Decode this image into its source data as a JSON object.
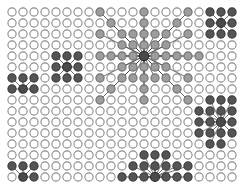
{
  "figure": {
    "title": "",
    "background_color": "#ffffff",
    "width": 244,
    "height": 189
  },
  "chart_data": {
    "type": "scatter",
    "title": "",
    "subtitle": "",
    "xlabel": "",
    "ylabel": "",
    "grid": false,
    "legend_position": "none",
    "lattice": {
      "columns": 21,
      "rows": 16,
      "origin_x": 12,
      "origin_y": 12,
      "spacing_x": 11.0,
      "spacing_y": 11.0,
      "node_radius": 4.1,
      "empty_node_fill": "#ffffff",
      "empty_node_stroke": "#8c8c8c",
      "empty_node_stroke_width": 1.1
    },
    "node_styles": {
      "light": {
        "fill": "#9d9d9d",
        "stroke": "#6e6e6e"
      },
      "dark": {
        "fill": "#555555",
        "stroke": "#3a3a3a"
      },
      "hub": {
        "fill": "#4a4a4a",
        "stroke": "#2e2e2e"
      }
    },
    "edge_style": {
      "color": "#4a4a4a",
      "width": 0.85,
      "opacity": 0.95
    },
    "clusters": [
      {
        "name": "large-central-hub",
        "hub_col": 12,
        "hub_row": 4,
        "hub_radius": 4.6,
        "node_style": "light",
        "spoke_count": 44,
        "max_spoke_reach": 5,
        "spokes": [
          [
            13,
            4
          ],
          [
            14,
            4
          ],
          [
            15,
            4
          ],
          [
            16,
            4
          ],
          [
            17,
            4
          ],
          [
            11,
            4
          ],
          [
            10,
            4
          ],
          [
            9,
            4
          ],
          [
            8,
            4
          ],
          [
            12,
            3
          ],
          [
            12,
            2
          ],
          [
            12,
            1
          ],
          [
            12,
            0
          ],
          [
            12,
            5
          ],
          [
            12,
            6
          ],
          [
            12,
            7
          ],
          [
            12,
            8
          ],
          [
            13,
            3
          ],
          [
            14,
            2
          ],
          [
            15,
            1
          ],
          [
            16,
            0
          ],
          [
            11,
            3
          ],
          [
            10,
            2
          ],
          [
            9,
            1
          ],
          [
            8,
            0
          ],
          [
            13,
            5
          ],
          [
            14,
            6
          ],
          [
            15,
            7
          ],
          [
            16,
            8
          ],
          [
            11,
            5
          ],
          [
            10,
            6
          ],
          [
            9,
            7
          ],
          [
            8,
            8
          ],
          [
            14,
            3
          ],
          [
            16,
            2
          ],
          [
            14,
            5
          ],
          [
            16,
            6
          ],
          [
            10,
            3
          ],
          [
            8,
            2
          ],
          [
            10,
            5
          ],
          [
            8,
            6
          ],
          [
            13,
            2
          ],
          [
            13,
            6
          ],
          [
            11,
            2
          ],
          [
            11,
            6
          ]
        ]
      },
      {
        "name": "mid-left-hub",
        "hub_col": 5,
        "hub_row": 5,
        "hub_radius": 4.4,
        "node_style": "dark",
        "spoke_count": 8,
        "max_spoke_reach": 1,
        "spokes": [
          [
            4,
            4
          ],
          [
            5,
            4
          ],
          [
            6,
            4
          ],
          [
            4,
            5
          ],
          [
            6,
            5
          ],
          [
            4,
            6
          ],
          [
            5,
            6
          ],
          [
            6,
            6
          ]
        ]
      },
      {
        "name": "top-right-cluster",
        "hub_col": 19,
        "hub_row": 1,
        "hub_radius": 4.4,
        "node_style": "dark",
        "spoke_count": 8,
        "max_spoke_reach": 1,
        "spokes": [
          [
            18,
            0
          ],
          [
            19,
            0
          ],
          [
            20,
            0
          ],
          [
            18,
            1
          ],
          [
            20,
            1
          ],
          [
            18,
            2
          ],
          [
            19,
            2
          ],
          [
            20,
            2
          ]
        ]
      },
      {
        "name": "bottom-right-hub",
        "hub_col": 19,
        "hub_row": 10,
        "hub_radius": 4.5,
        "node_style": "dark",
        "spoke_count": 16,
        "max_spoke_reach": 2,
        "spokes": [
          [
            18,
            9
          ],
          [
            19,
            9
          ],
          [
            20,
            9
          ],
          [
            18,
            10
          ],
          [
            20,
            10
          ],
          [
            18,
            11
          ],
          [
            19,
            11
          ],
          [
            20,
            11
          ],
          [
            17,
            9
          ],
          [
            17,
            10
          ],
          [
            17,
            11
          ],
          [
            19,
            8
          ],
          [
            18,
            8
          ],
          [
            20,
            8
          ],
          [
            19,
            12
          ],
          [
            18,
            12
          ]
        ]
      },
      {
        "name": "bottom-center-hub",
        "hub_col": 13,
        "hub_row": 15,
        "hub_radius": 4.5,
        "node_style": "dark",
        "spoke_count": 15,
        "max_spoke_reach": 2,
        "spokes": [
          [
            12,
            15
          ],
          [
            14,
            15
          ],
          [
            15,
            15
          ],
          [
            11,
            15
          ],
          [
            12,
            14
          ],
          [
            13,
            14
          ],
          [
            14,
            14
          ],
          [
            11,
            14
          ],
          [
            15,
            14
          ],
          [
            12,
            13
          ],
          [
            13,
            13
          ],
          [
            14,
            13
          ],
          [
            16,
            15
          ],
          [
            10,
            15
          ],
          [
            16,
            14
          ]
        ]
      },
      {
        "name": "left-upper-small-cluster",
        "hub_col": 1,
        "hub_row": 7,
        "hub_radius": 4.3,
        "node_style": "dark",
        "spoke_count": 5,
        "max_spoke_reach": 1,
        "spokes": [
          [
            0,
            6
          ],
          [
            1,
            6
          ],
          [
            2,
            6
          ],
          [
            0,
            7
          ],
          [
            2,
            7
          ]
        ]
      },
      {
        "name": "left-lower-small-cluster",
        "hub_col": 1,
        "hub_row": 15,
        "hub_radius": 4.3,
        "node_style": "dark",
        "spoke_count": 4,
        "max_spoke_reach": 1,
        "spokes": [
          [
            0,
            14
          ],
          [
            1,
            14
          ],
          [
            2,
            14
          ],
          [
            2,
            15
          ]
        ]
      }
    ]
  }
}
